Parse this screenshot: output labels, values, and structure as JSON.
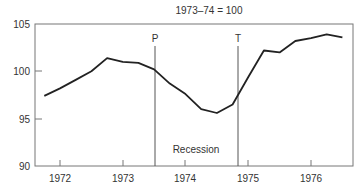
{
  "chart_data": {
    "type": "line",
    "title": "1973–74 = 100",
    "xlabel": "",
    "ylabel": "",
    "ylim": [
      90,
      105
    ],
    "yticks": [
      90,
      95,
      100,
      105
    ],
    "xtick_labels": [
      "1972",
      "1973",
      "1974",
      "1975",
      "1976"
    ],
    "grid": false,
    "legend": null,
    "annotations": [
      {
        "label": "P",
        "x": 1973.5,
        "type": "vertical-line",
        "meaning": "peak"
      },
      {
        "label": "T",
        "x": 1974.83,
        "type": "vertical-line",
        "meaning": "trough"
      },
      {
        "label": "Recession",
        "x": 1974.2,
        "y": 91.8,
        "type": "text"
      }
    ],
    "series": [
      {
        "name": "Index",
        "x": [
          1971.75,
          1972.0,
          1972.25,
          1972.5,
          1972.75,
          1973.0,
          1973.25,
          1973.5,
          1973.75,
          1974.0,
          1974.25,
          1974.5,
          1974.75,
          1975.0,
          1975.25,
          1975.5,
          1975.75,
          1976.0,
          1976.25,
          1976.5
        ],
        "values": [
          97.4,
          98.2,
          99.1,
          100.0,
          101.4,
          101.0,
          100.9,
          100.2,
          98.7,
          97.6,
          96.0,
          95.6,
          96.5,
          99.4,
          102.2,
          102.0,
          103.2,
          103.5,
          103.9,
          103.6
        ]
      }
    ]
  }
}
